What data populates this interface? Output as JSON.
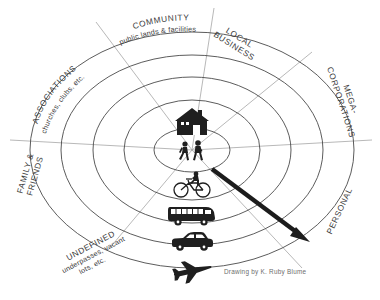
{
  "figure": {
    "background_color": "#ffffff",
    "line_color": "#4a4a4a",
    "spoke_color": "#9a9a9a",
    "arrow_color": "#1c1c1c",
    "credit": "Drawing by K. Ruby Blume"
  },
  "sectors": [
    {
      "id": "associations",
      "main": "ASSOCIATIONS",
      "sub": "churches, clubs, etc.",
      "position": "upper-left"
    },
    {
      "id": "community",
      "main": "COMMUNITY",
      "sub": "public lands & facilities",
      "position": "top"
    },
    {
      "id": "local-business",
      "main_line1": "LOCAL",
      "main_line2": "BUSINESS",
      "sub": "",
      "position": "upper-right"
    },
    {
      "id": "mega-corporations",
      "main_line1": "MEGA-",
      "main_line2": "CORPORATIONS",
      "sub": "",
      "position": "right-upper"
    },
    {
      "id": "personal",
      "main": "PERSONAL",
      "sub": "",
      "position": "right-lower"
    },
    {
      "id": "undefined",
      "main": "UNDEFINED",
      "sub_line1": "underpasses, vacant",
      "sub_line2": "lots, etc.",
      "position": "lower-left"
    },
    {
      "id": "family-friends",
      "main_line1": "FAMILY &",
      "main_line2": "FRIENDS",
      "sub": "",
      "position": "left"
    }
  ],
  "rings": {
    "count": 5,
    "core_label": "home",
    "items": [
      {
        "id": "ring-core",
        "semi_x": 38,
        "semi_y": 22
      },
      {
        "id": "ring-1",
        "semi_x": 68,
        "semi_y": 50
      },
      {
        "id": "ring-2",
        "semi_x": 99,
        "semi_y": 73
      },
      {
        "id": "ring-3",
        "semi_x": 131,
        "semi_y": 95
      },
      {
        "id": "ring-4",
        "semi_x": 162,
        "semi_y": 118
      }
    ]
  },
  "mode_icons": [
    {
      "id": "house-icon",
      "name": "house",
      "ring": "core",
      "cx": 192,
      "cy": 124
    },
    {
      "id": "pedestrian-icon",
      "name": "pedestrians-walking",
      "ring": "core",
      "cx": 192,
      "cy": 153
    },
    {
      "id": "bicycle-icon",
      "name": "bicycle",
      "ring": "ring-1",
      "cx": 192,
      "cy": 186
    },
    {
      "id": "bus-icon",
      "name": "bus",
      "ring": "ring-2",
      "cx": 192,
      "cy": 215
    },
    {
      "id": "car-icon",
      "name": "car",
      "ring": "ring-3",
      "cx": 192,
      "cy": 243
    },
    {
      "id": "airplane-icon",
      "name": "airplane",
      "ring": "ring-4",
      "cx": 192,
      "cy": 271
    }
  ],
  "arrow": {
    "id": "direction-arrow",
    "from_x": 212,
    "from_y": 169,
    "to_x": 308,
    "to_y": 241,
    "description": "thick black arrow from center outward to lower right"
  }
}
